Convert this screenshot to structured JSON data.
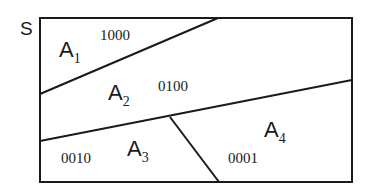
{
  "diagram": {
    "set_label": "S",
    "regions": [
      {
        "name": "A",
        "sub": "1",
        "code": "1000"
      },
      {
        "name": "A",
        "sub": "2",
        "code": "0100"
      },
      {
        "name": "A",
        "sub": "3",
        "code": "0010"
      },
      {
        "name": "A",
        "sub": "4",
        "code": "0001"
      }
    ],
    "colors": {
      "stroke": "#1a1a1a",
      "background": "#ffffff"
    }
  }
}
